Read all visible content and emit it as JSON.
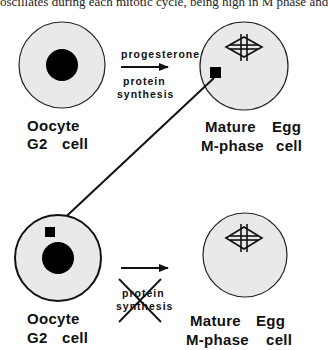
{
  "caption": "oscillates during each mitotic cycle, being high in M phase and",
  "top_row": {
    "left_cell": {
      "line1": "Oocyte",
      "line2_a": "G2",
      "line2_b": "cell"
    },
    "arrow_above": "progesterone",
    "arrow_below_1": "protein",
    "arrow_below_2": "synthesis",
    "right_cell": {
      "line1_a": "Mature",
      "line1_b": "Egg",
      "line2_a": "M-phase",
      "line2_b": "cell"
    }
  },
  "bottom_row": {
    "left_cell": {
      "line1": "Oocyte",
      "line2_a": "G2",
      "line2_b": "cell"
    },
    "arrow_below_1": "protein",
    "arrow_below_2": "synthesis",
    "right_cell": {
      "line1_a": "Mature",
      "line1_b": "Egg",
      "line2_a": "M-phase",
      "line2_b": "cell"
    }
  },
  "colors": {
    "cell_fill": "#e9e9e9",
    "ink": "#111111"
  }
}
